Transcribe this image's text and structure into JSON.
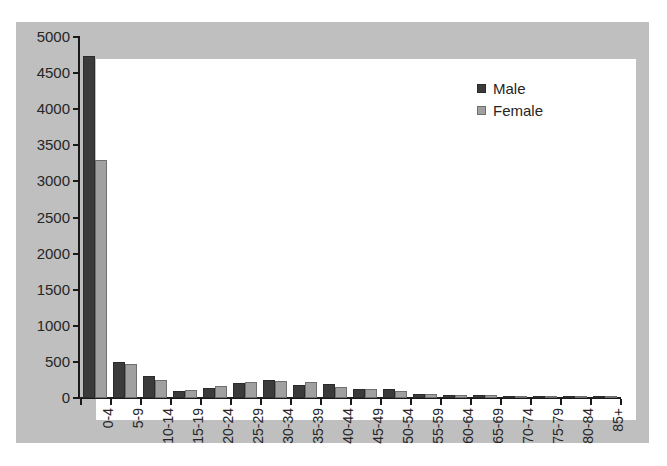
{
  "chart_data": {
    "type": "bar",
    "title": "",
    "subtitle": "",
    "xlabel": "",
    "ylabel": "",
    "ylim": [
      0,
      5000
    ],
    "ytick_step": 500,
    "yticks": [
      "0",
      "500",
      "1000",
      "1500",
      "2000",
      "2500",
      "3000",
      "3500",
      "4000",
      "4500",
      "5000"
    ],
    "grid": false,
    "legend_position": "top-right",
    "categories": [
      "0-4",
      "5-9",
      "10-14",
      "15-19",
      "20-24",
      "25-29",
      "30-34",
      "35-39",
      "40-44",
      "45-49",
      "50-54",
      "55-59",
      "60-64",
      "65-69",
      "70-74",
      "75-79",
      "80-84",
      "85+"
    ],
    "series": [
      {
        "name": "Male",
        "color": "#3b3b3b",
        "values": [
          4730,
          500,
          310,
          95,
          140,
          205,
          245,
          185,
          195,
          125,
          120,
          60,
          40,
          45,
          30,
          20,
          15,
          10
        ]
      },
      {
        "name": "Female",
        "color": "#a0a0a0",
        "values": [
          3290,
          470,
          245,
          105,
          165,
          215,
          230,
          215,
          150,
          130,
          95,
          55,
          45,
          35,
          25,
          20,
          15,
          10
        ]
      }
    ]
  },
  "legend": {
    "items": [
      {
        "label": "Male",
        "swatch": "male"
      },
      {
        "label": "Female",
        "swatch": "female"
      }
    ]
  },
  "colors": {
    "page_background": "#ffffff",
    "frame_background": "#bfbfbf",
    "plot_background": "#ffffff",
    "axis": "#1a1a1a",
    "male": "#3b3b3b",
    "female": "#a0a0a0"
  }
}
